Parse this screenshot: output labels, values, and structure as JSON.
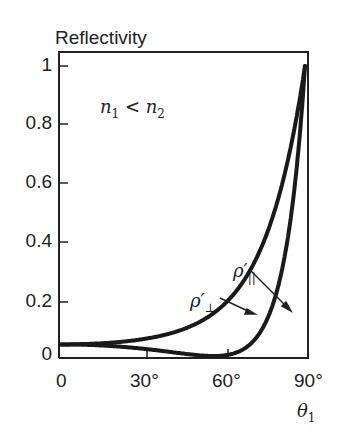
{
  "chart_data": {
    "type": "line",
    "title": "",
    "ylabel": "Reflectivity",
    "xlabel": "θ1",
    "xlim": [
      0,
      90
    ],
    "ylim": [
      0,
      1.05
    ],
    "x_ticks": [
      "0",
      "30°",
      "60°",
      "90°"
    ],
    "y_ticks": [
      "0",
      "0.2",
      "0.4",
      "0.6",
      "0.8",
      "1"
    ],
    "annotation": "n1 < n2",
    "grid": false,
    "x": [
      0,
      10,
      20,
      30,
      40,
      50,
      56.3,
      60,
      70,
      75,
      80,
      85,
      88,
      90
    ],
    "series": [
      {
        "name": "ρ'⊥",
        "values": [
          0.04,
          0.042,
          0.047,
          0.058,
          0.077,
          0.115,
          0.15,
          0.177,
          0.3,
          0.4,
          0.54,
          0.73,
          0.88,
          1.0
        ]
      },
      {
        "name": "ρ'∥",
        "values": [
          0.04,
          0.038,
          0.033,
          0.025,
          0.013,
          0.002,
          0.0,
          0.002,
          0.042,
          0.1,
          0.24,
          0.52,
          0.77,
          1.0
        ]
      }
    ]
  },
  "labels": {
    "ylabel": "Reflectivity",
    "xlabel": "θ",
    "xlabel_sub": "1",
    "annotation": "n",
    "annotation_sub1": "1",
    "annotation_mid": " < n",
    "annotation_sub2": "2",
    "rho_perp": "ρ′",
    "rho_perp_sub": "⊥",
    "rho_par": "ρ′",
    "rho_par_sub": "||",
    "yt0": "0",
    "yt02": "0.2",
    "yt04": "0.4",
    "yt06": "0.6",
    "yt08": "0.8",
    "yt1": "1",
    "xt0": "0",
    "xt30": "30°",
    "xt60": "60°",
    "xt90": "90°"
  }
}
